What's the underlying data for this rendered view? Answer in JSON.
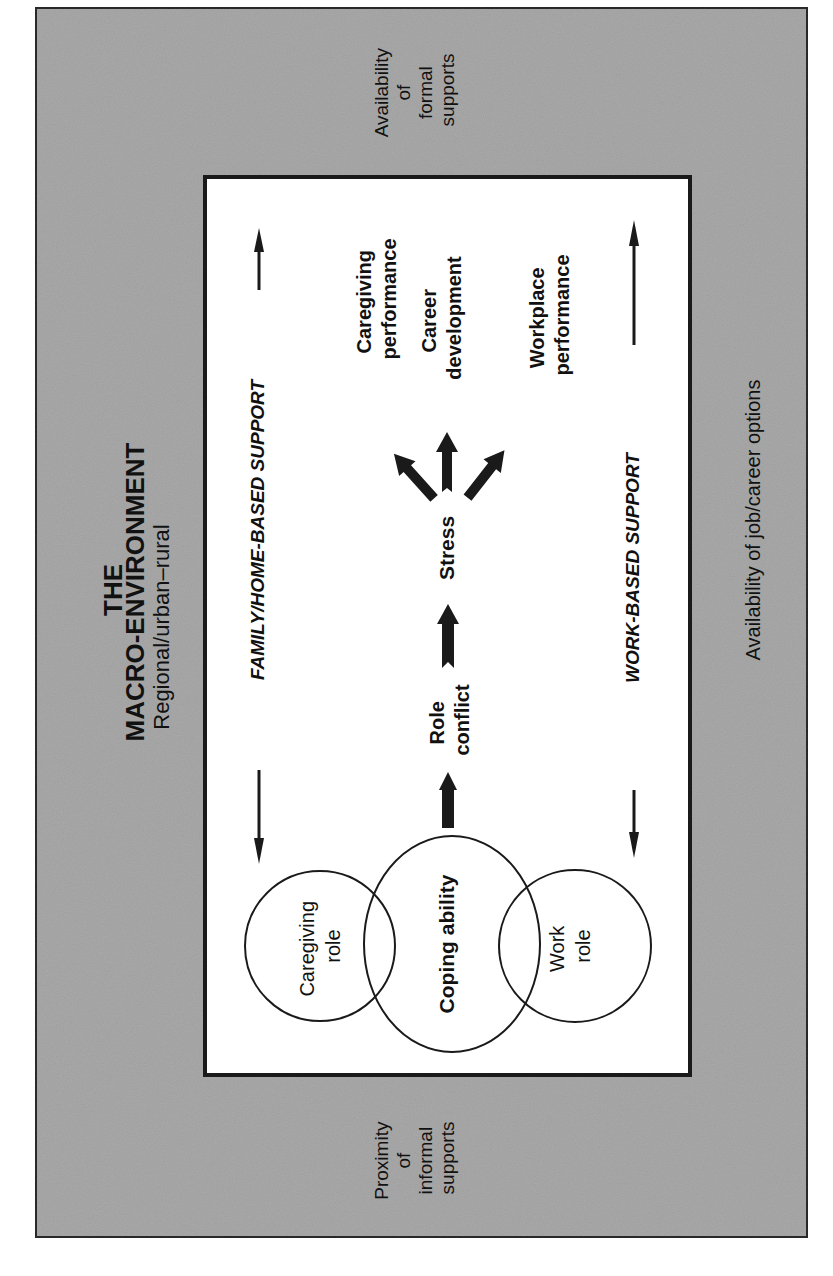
{
  "colors": {
    "outer_fill": "#a9a9a9",
    "outer_border": "#2a2a2a",
    "inner_fill": "#ffffff",
    "ink": "#111111"
  },
  "macro_environment": {
    "title_line1": "THE",
    "title_line2": "MACRO-ENVIRONMENT",
    "subtitle": "Regional/urban–rural",
    "top_label": [
      "Availability",
      "of",
      "formal",
      "supports"
    ],
    "bottom_label": [
      "Proximity",
      "of",
      "informal",
      "supports"
    ],
    "right_label": "Availability of job/career options"
  },
  "supports": {
    "family": "FAMILY/HOME-BASED SUPPORT",
    "work": "WORK-BASED SUPPORT"
  },
  "circles": {
    "caregiving": [
      "Caregiving",
      "role"
    ],
    "coping": "Coping ability",
    "work": [
      "Work",
      "role"
    ]
  },
  "flow": {
    "role_conflict": [
      "Role",
      "conflict"
    ],
    "stress": "Stress"
  },
  "outcomes": {
    "caregiving": [
      "Caregiving",
      "performance"
    ],
    "career": [
      "Career",
      "development"
    ],
    "workplace": [
      "Workplace",
      "performance"
    ]
  }
}
